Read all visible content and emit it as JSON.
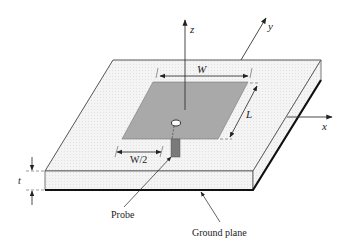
{
  "diagram": {
    "axes": {
      "z_label": "z",
      "y_label": "y",
      "x_label": "x"
    },
    "dimensions": {
      "width_label": "W",
      "length_label": "L",
      "half_width_label": "W/2",
      "thickness_label": "t"
    },
    "callouts": {
      "probe_label": "Probe",
      "ground_plane_label": "Ground plane"
    },
    "colors": {
      "patch_fill": "#a9a9a9",
      "substrate_fill": "#f3f3f3",
      "line": "#333333",
      "probe_fill": "#7a7a7a"
    }
  }
}
